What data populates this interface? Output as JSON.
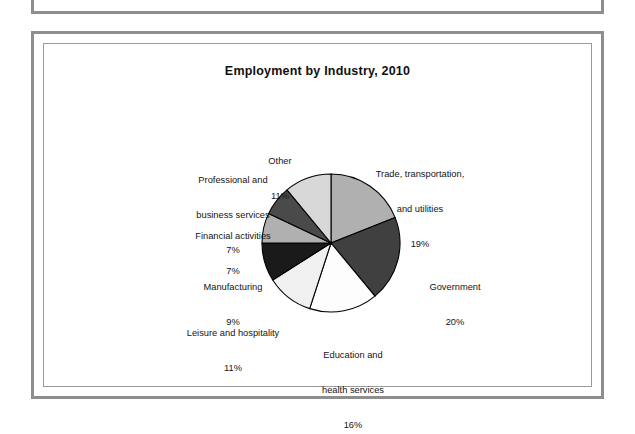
{
  "chart_data": {
    "type": "pie",
    "title": "Employment by Industry, 2010",
    "unit": "percent",
    "legend_position": "none-outside-labels",
    "categories": [
      "Trade, transportation, and utilities",
      "Government",
      "Education and health services",
      "Leisure and hospitality",
      "Manufacturing",
      "Financial activities",
      "Professional and business services",
      "Other"
    ],
    "values": [
      19,
      20,
      16,
      11,
      9,
      7,
      7,
      11
    ],
    "slices": [
      {
        "label_lines": [
          "Trade, transportation,",
          "and utilities"
        ],
        "value_text": "19%",
        "value": 19,
        "color": "#b0b0b0",
        "label_position": "upper-right"
      },
      {
        "label_lines": [
          "Government"
        ],
        "value_text": "20%",
        "value": 20,
        "color": "#404040",
        "label_position": "right"
      },
      {
        "label_lines": [
          "Education and",
          "health services"
        ],
        "value_text": "16%",
        "value": 16,
        "color": "#fdfdfd",
        "label_position": "bottom"
      },
      {
        "label_lines": [
          "Leisure and hospitality"
        ],
        "value_text": "11%",
        "value": 11,
        "color": "#f0f0f0",
        "label_position": "lower-left"
      },
      {
        "label_lines": [
          "Manufacturing"
        ],
        "value_text": "9%",
        "value": 9,
        "color": "#1a1a1a",
        "label_position": "left"
      },
      {
        "label_lines": [
          "Financial activities"
        ],
        "value_text": "7%",
        "value": 7,
        "color": "#b0b0b0",
        "label_position": "upper-left"
      },
      {
        "label_lines": [
          "Professional and",
          "business services"
        ],
        "value_text": "7%",
        "value": 7,
        "color": "#4a4a4a",
        "label_position": "top-left"
      },
      {
        "label_lines": [
          "Other"
        ],
        "value_text": "11%",
        "value": 11,
        "color": "#d8d8d8",
        "label_position": "top"
      }
    ],
    "labels_rendered": {
      "trade": "Trade, transportation,\nand utilities\n19%",
      "government": "Government\n20%",
      "education": "Education and\nhealth services\n16%",
      "leisure": "Leisure and hospitality\n11%",
      "manufacturing": "Manufacturing\n9%",
      "financial": "Financial activities\n7%",
      "professional": "Professional and\nbusiness services\n7%",
      "other": "Other\n11%"
    },
    "geometry": {
      "center_x": 331,
      "center_y": 243,
      "radius": 69,
      "start_angle_deg": 0,
      "direction": "clockwise"
    },
    "style": {
      "outline_color": "#000000",
      "background": "#ffffff",
      "frame_color": "#8e8e8e"
    }
  }
}
